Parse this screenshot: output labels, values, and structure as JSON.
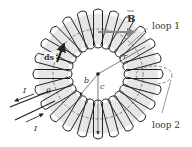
{
  "diagram": {
    "labels": {
      "B": "B",
      "loop1": "loop 1",
      "loop2": "loop 2",
      "ds": "ds",
      "r": "r",
      "b": "b",
      "c": "c",
      "theta": "θ",
      "I_top": "I",
      "I_bottom": "I"
    },
    "colors": {
      "wire": "#222222",
      "core": "#e6e6e6",
      "loop_dashed": "#777777",
      "arrow_gray": "#888888",
      "text": "#333333"
    },
    "geometry": {
      "center": [
        98,
        74
      ],
      "outer_radius": 60,
      "inner_radius": 30,
      "turns": 24
    }
  }
}
